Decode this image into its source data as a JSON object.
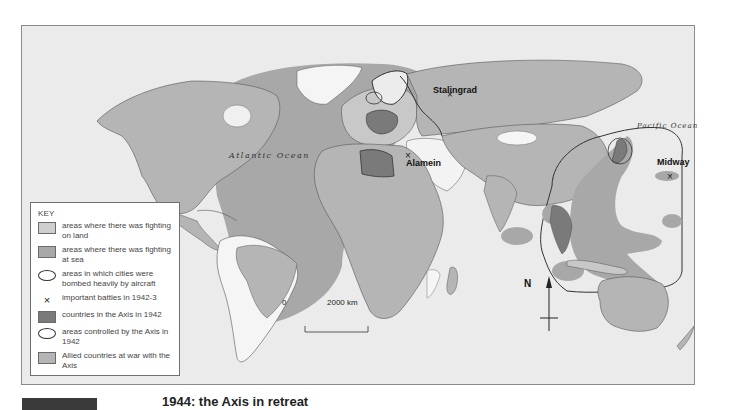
{
  "map": {
    "ocean_labels": {
      "atlantic": "Atlantic Ocean",
      "pacific": "Pacific Ocean"
    },
    "battles": [
      {
        "name": "Stalingrad",
        "marker": "×"
      },
      {
        "name": "Alamein",
        "marker": "×"
      },
      {
        "name": "Midway",
        "marker": "×"
      }
    ],
    "scale_bar": {
      "start": "0",
      "end": "2000 km"
    },
    "north_arrow": {
      "label": "N"
    },
    "colors": {
      "background": "#ebebeb",
      "fighting_on_land": "#cfcfcf",
      "fighting_at_sea": "#a8a8a8",
      "axis_countries": "#7a7a7a",
      "allied_countries": "#b5b5b5",
      "neutral_land": "#f7f7f7",
      "border": "#555555"
    }
  },
  "legend": {
    "title": "KEY",
    "items": [
      {
        "symbol": "swatch-light",
        "text": "areas where there was fighting on land"
      },
      {
        "symbol": "swatch-medium",
        "text": "areas where there was fighting at sea"
      },
      {
        "symbol": "ring",
        "text": "areas in which cities were bombed heavily by aircraft"
      },
      {
        "symbol": "cross",
        "glyph": "×",
        "text": "important battles in 1942-3"
      },
      {
        "symbol": "swatch-dark",
        "text": "countries in the Axis in 1942"
      },
      {
        "symbol": "ring",
        "text": "areas controlled by the Axis in        1942"
      },
      {
        "symbol": "swatch-allied",
        "text": "Allied countries at war with the Axis"
      }
    ]
  },
  "caption": {
    "text": "1944: the Axis in retreat"
  }
}
